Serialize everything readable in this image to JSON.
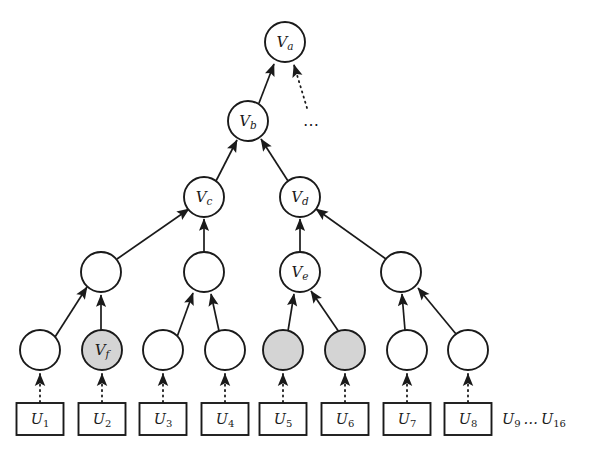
{
  "figure": {
    "caption_fragment": "",
    "colors": {
      "stroke": "#1a1a1a",
      "node_fill_plain": "#ffffff",
      "node_fill_shaded": "#d4d4d4",
      "background": "#ffffff",
      "text": "#1a1a1a"
    },
    "ellipsis": "⋯",
    "tail_text": "U₉ … U₁₆",
    "tail_base": "U",
    "tail_sub_start": "9",
    "tail_sub_end": "16"
  },
  "nodes": {
    "level_0": [
      {
        "id": "Va",
        "base": "V",
        "sub": "a",
        "label": "V_a",
        "cx": 285,
        "cy": 42,
        "r": 20,
        "shaded": false
      }
    ],
    "level_1": [
      {
        "id": "Vb",
        "base": "V",
        "sub": "b",
        "label": "V_b",
        "cx": 248,
        "cy": 121,
        "r": 20,
        "shaded": false
      }
    ],
    "level_2": [
      {
        "id": "Vc",
        "base": "V",
        "sub": "c",
        "label": "V_c",
        "cx": 204,
        "cy": 197,
        "r": 20,
        "shaded": false
      },
      {
        "id": "Vd",
        "base": "V",
        "sub": "d",
        "label": "V_d",
        "cx": 300,
        "cy": 197,
        "r": 20,
        "shaded": false
      }
    ],
    "level_3": [
      {
        "id": "n3a",
        "base": "",
        "sub": "",
        "label": "",
        "cx": 101,
        "cy": 272,
        "r": 20,
        "shaded": false
      },
      {
        "id": "n3b",
        "base": "",
        "sub": "",
        "label": "",
        "cx": 204,
        "cy": 272,
        "r": 20,
        "shaded": false
      },
      {
        "id": "Ve",
        "base": "V",
        "sub": "e",
        "label": "V_e",
        "cx": 300,
        "cy": 272,
        "r": 20,
        "shaded": false
      },
      {
        "id": "n3d",
        "base": "",
        "sub": "",
        "label": "",
        "cx": 401,
        "cy": 272,
        "r": 20,
        "shaded": false
      }
    ],
    "level_4": [
      {
        "id": "n4a",
        "base": "",
        "sub": "",
        "label": "",
        "cx": 40,
        "cy": 350,
        "r": 20,
        "shaded": false
      },
      {
        "id": "Vf",
        "base": "V",
        "sub": "f",
        "label": "V_f",
        "cx": 102,
        "cy": 350,
        "r": 20,
        "shaded": true
      },
      {
        "id": "n4c",
        "base": "",
        "sub": "",
        "label": "",
        "cx": 163,
        "cy": 350,
        "r": 20,
        "shaded": false
      },
      {
        "id": "n4d",
        "base": "",
        "sub": "",
        "label": "",
        "cx": 225,
        "cy": 350,
        "r": 20,
        "shaded": false
      },
      {
        "id": "n4e",
        "base": "",
        "sub": "",
        "label": "",
        "cx": 283,
        "cy": 350,
        "r": 20,
        "shaded": true
      },
      {
        "id": "n4f",
        "base": "",
        "sub": "",
        "label": "",
        "cx": 345,
        "cy": 350,
        "r": 20,
        "shaded": true
      },
      {
        "id": "n4g",
        "base": "",
        "sub": "",
        "label": "",
        "cx": 407,
        "cy": 350,
        "r": 20,
        "shaded": false
      },
      {
        "id": "n4h",
        "base": "",
        "sub": "",
        "label": "",
        "cx": 468,
        "cy": 350,
        "r": 20,
        "shaded": false
      }
    ]
  },
  "leaves": [
    {
      "id": "U1",
      "base": "U",
      "sub": "1",
      "label": "U_1",
      "cx": 40,
      "cy": 419,
      "w": 47,
      "h": 32
    },
    {
      "id": "U2",
      "base": "U",
      "sub": "2",
      "label": "U_2",
      "cx": 102,
      "cy": 419,
      "w": 47,
      "h": 32
    },
    {
      "id": "U3",
      "base": "U",
      "sub": "3",
      "label": "U_3",
      "cx": 163,
      "cy": 419,
      "w": 47,
      "h": 32
    },
    {
      "id": "U4",
      "base": "U",
      "sub": "4",
      "label": "U_4",
      "cx": 225,
      "cy": 419,
      "w": 47,
      "h": 32
    },
    {
      "id": "U5",
      "base": "U",
      "sub": "5",
      "label": "U_5",
      "cx": 283,
      "cy": 419,
      "w": 47,
      "h": 32
    },
    {
      "id": "U6",
      "base": "U",
      "sub": "6",
      "label": "U_6",
      "cx": 345,
      "cy": 419,
      "w": 47,
      "h": 32
    },
    {
      "id": "U7",
      "base": "U",
      "sub": "7",
      "label": "U_7",
      "cx": 407,
      "cy": 419,
      "w": 47,
      "h": 32
    },
    {
      "id": "U8",
      "base": "U",
      "sub": "8",
      "label": "U_8",
      "cx": 468,
      "cy": 419,
      "w": 47,
      "h": 32
    }
  ],
  "tail": {
    "cx": 500,
    "cy": 419
  },
  "ellipsis_marker": {
    "cx": 312,
    "cy": 124
  },
  "edges_solid_arrow": [
    {
      "from": "Vb",
      "to": "Va"
    },
    {
      "from": "Vc",
      "to": "Vb"
    },
    {
      "from": "Vd",
      "to": "Vb"
    },
    {
      "from": "n3a",
      "to": "Vc"
    },
    {
      "from": "n3b",
      "to": "Vc"
    },
    {
      "from": "Ve",
      "to": "Vd"
    },
    {
      "from": "n3d",
      "to": "Vd"
    },
    {
      "from": "n4a",
      "to": "n3a"
    },
    {
      "from": "Vf",
      "to": "n3a"
    },
    {
      "from": "n4c",
      "to": "n3b"
    },
    {
      "from": "n4d",
      "to": "n3b"
    },
    {
      "from": "n4e",
      "to": "Ve"
    },
    {
      "from": "n4f",
      "to": "Ve"
    },
    {
      "from": "n4g",
      "to": "n3d"
    },
    {
      "from": "n4h",
      "to": "n3d"
    }
  ],
  "edges_dotted_arrow": [
    {
      "from": "ellipsis-source",
      "to": "Va"
    },
    {
      "from": "U1",
      "to": "n4a"
    },
    {
      "from": "U2",
      "to": "Vf"
    },
    {
      "from": "U3",
      "to": "n4c"
    },
    {
      "from": "U4",
      "to": "n4d"
    },
    {
      "from": "U5",
      "to": "n4e"
    },
    {
      "from": "U6",
      "to": "n4f"
    },
    {
      "from": "U7",
      "to": "n4g"
    },
    {
      "from": "U8",
      "to": "n4h"
    }
  ]
}
